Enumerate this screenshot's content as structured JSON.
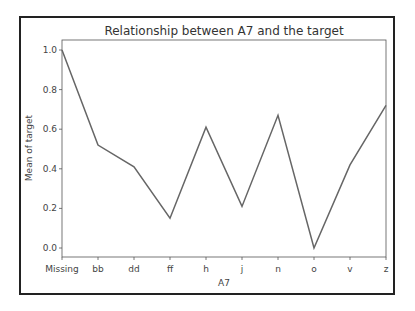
{
  "chart_data": {
    "type": "line",
    "title": "Relationship between A7 and the target",
    "xlabel": "A7",
    "ylabel": "Mean of target",
    "categories": [
      "Missing",
      "bb",
      "dd",
      "ff",
      "h",
      "j",
      "n",
      "o",
      "v",
      "z"
    ],
    "values": [
      1.0,
      0.52,
      0.41,
      0.15,
      0.61,
      0.21,
      0.67,
      0.0,
      0.42,
      0.72
    ],
    "yticks": [
      "0.0",
      "0.2",
      "0.4",
      "0.6",
      "0.8",
      "1.0"
    ],
    "ylim": [
      -0.05,
      1.05
    ],
    "grid": false,
    "legend": null,
    "line_color": "#666666"
  }
}
